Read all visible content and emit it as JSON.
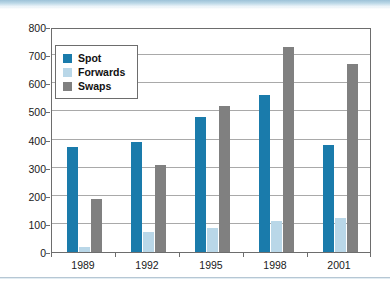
{
  "chart_data": {
    "type": "bar",
    "title": "",
    "subtitle": "",
    "xlabel": "",
    "ylabel": "",
    "categories": [
      "1989",
      "1992",
      "1995",
      "1998",
      "2001"
    ],
    "series": [
      {
        "name": "Spot",
        "color": "#1a7bab",
        "values": [
          375,
          390,
          480,
          560,
          380
        ]
      },
      {
        "name": "Forwards",
        "color": "#b9d7e8",
        "values": [
          18,
          70,
          85,
          110,
          120
        ]
      },
      {
        "name": "Swaps",
        "color": "#808080",
        "values": [
          190,
          310,
          520,
          730,
          670
        ]
      }
    ],
    "ylim": [
      0,
      800
    ],
    "ytick_values": [
      0,
      100,
      200,
      300,
      400,
      500,
      600,
      700,
      800
    ],
    "ytick_labels": [
      "0",
      "100",
      "200",
      "300",
      "400",
      "500",
      "600",
      "700",
      "800"
    ],
    "grid": true,
    "legend_position": "inside-top-left",
    "legend_entries": [
      "Spot",
      "Forwards",
      "Swaps"
    ]
  },
  "colors": {
    "spot": "#1a7bab",
    "forwards": "#b9d7e8",
    "swaps": "#808080",
    "axis": "#6d6d6d",
    "gridline": "#a9a9a9",
    "text": "#1a1a1a",
    "header_strip": "#9dc2d8",
    "bottom_rule": "#b6c7d4"
  }
}
